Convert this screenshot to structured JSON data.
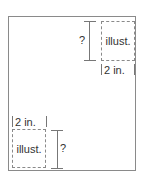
{
  "diagram": {
    "top_right": {
      "illustration_label": "illust.",
      "width_label": "2 in.",
      "height_label": "?"
    },
    "bottom_left": {
      "illustration_label": "illust.",
      "width_label": "2 in.",
      "height_label": "?"
    }
  }
}
